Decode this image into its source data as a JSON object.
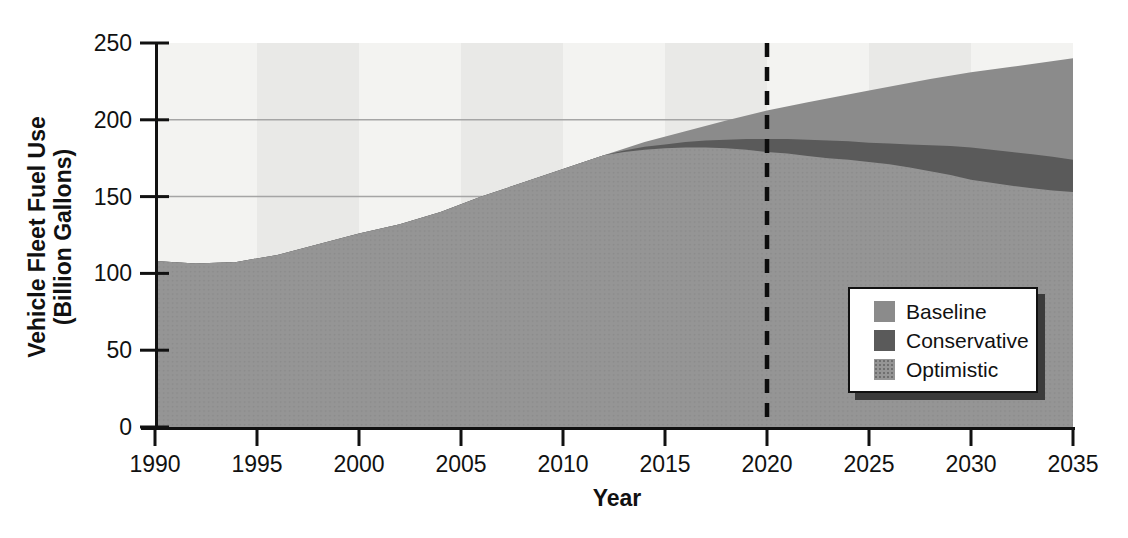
{
  "page": {
    "background": "#ffffff"
  },
  "chart_data": {
    "type": "area",
    "title": "",
    "xlabel": "Year",
    "ylabel": "Vehicle Fleet Fuel Use (Billion Gallons)",
    "ylabel_line1": "Vehicle Fleet Fuel Use",
    "ylabel_line2": "(Billion Gallons)",
    "xlim": [
      1990,
      2035
    ],
    "ylim": [
      0,
      250
    ],
    "x_ticks": [
      1990,
      1995,
      2000,
      2005,
      2010,
      2015,
      2020,
      2025,
      2030,
      2035
    ],
    "y_ticks": [
      0,
      50,
      100,
      150,
      200,
      250
    ],
    "grid_y_values": [
      150,
      200
    ],
    "grid_color": "#a5a5a5",
    "axis_color": "#111111",
    "vertical_marker": {
      "year": 2020,
      "style": "dashed",
      "color": "#0d0d0d"
    },
    "background_bands": {
      "interval_years": 5,
      "colors": [
        "#f3f3f1",
        "#e9e9e7"
      ]
    },
    "legend": {
      "position": "bottom-right",
      "entries": [
        "Baseline",
        "Conservative",
        "Optimistic"
      ]
    },
    "series": [
      {
        "name": "Baseline",
        "color": "#8b8b8b",
        "texture": "solid",
        "points": [
          [
            1990,
            108
          ],
          [
            1992,
            106.5
          ],
          [
            1994,
            107.5
          ],
          [
            1996,
            112
          ],
          [
            1998,
            119
          ],
          [
            2000,
            126
          ],
          [
            2002,
            132
          ],
          [
            2004,
            140
          ],
          [
            2006,
            150
          ],
          [
            2008,
            159
          ],
          [
            2010,
            168
          ],
          [
            2012,
            177
          ],
          [
            2014,
            185.5
          ],
          [
            2016,
            192.5
          ],
          [
            2018,
            199.5
          ],
          [
            2020,
            206
          ],
          [
            2022,
            211.5
          ],
          [
            2025,
            219
          ],
          [
            2028,
            226.5
          ],
          [
            2030,
            231
          ],
          [
            2032,
            234.5
          ],
          [
            2035,
            240
          ]
        ]
      },
      {
        "name": "Conservative",
        "color": "#5a5a5a",
        "texture": "solid",
        "points": [
          [
            1990,
            108
          ],
          [
            1992,
            106.5
          ],
          [
            1994,
            107.5
          ],
          [
            1996,
            112
          ],
          [
            1998,
            119
          ],
          [
            2000,
            126
          ],
          [
            2002,
            132
          ],
          [
            2004,
            140
          ],
          [
            2006,
            150
          ],
          [
            2008,
            159
          ],
          [
            2010,
            168
          ],
          [
            2012,
            177
          ],
          [
            2013,
            180
          ],
          [
            2014,
            182.5
          ],
          [
            2015,
            184
          ],
          [
            2016,
            185.5
          ],
          [
            2017,
            186.5
          ],
          [
            2018,
            187
          ],
          [
            2019,
            187.5
          ],
          [
            2020,
            187.5
          ],
          [
            2021,
            187.5
          ],
          [
            2022,
            187
          ],
          [
            2023,
            186.5
          ],
          [
            2024,
            186
          ],
          [
            2025,
            185
          ],
          [
            2026,
            184.5
          ],
          [
            2027,
            184
          ],
          [
            2028,
            183.5
          ],
          [
            2029,
            183
          ],
          [
            2030,
            182
          ],
          [
            2031,
            180.5
          ],
          [
            2032,
            179
          ],
          [
            2033,
            177.5
          ],
          [
            2034,
            176
          ],
          [
            2035,
            174
          ]
        ]
      },
      {
        "name": "Optimistic",
        "color": "#959595",
        "texture": "dots",
        "points": [
          [
            1990,
            108
          ],
          [
            1992,
            106.5
          ],
          [
            1994,
            107.5
          ],
          [
            1996,
            112
          ],
          [
            1998,
            119
          ],
          [
            2000,
            126
          ],
          [
            2002,
            132
          ],
          [
            2004,
            140
          ],
          [
            2006,
            150
          ],
          [
            2008,
            159
          ],
          [
            2010,
            168
          ],
          [
            2012,
            177
          ],
          [
            2013,
            179
          ],
          [
            2014,
            180.5
          ],
          [
            2015,
            181.5
          ],
          [
            2016,
            182
          ],
          [
            2017,
            182
          ],
          [
            2018,
            181.5
          ],
          [
            2019,
            180.5
          ],
          [
            2020,
            179
          ],
          [
            2021,
            178
          ],
          [
            2022,
            176.5
          ],
          [
            2023,
            175
          ],
          [
            2024,
            174
          ],
          [
            2025,
            172.5
          ],
          [
            2026,
            171
          ],
          [
            2027,
            169
          ],
          [
            2028,
            166.5
          ],
          [
            2029,
            164
          ],
          [
            2030,
            161
          ],
          [
            2031,
            159
          ],
          [
            2032,
            157
          ],
          [
            2033,
            155.5
          ],
          [
            2034,
            154
          ],
          [
            2035,
            153
          ]
        ]
      }
    ]
  }
}
